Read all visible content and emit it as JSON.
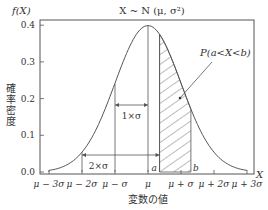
{
  "chart_data": {
    "type": "line",
    "title": "X ~ N (μ, σ²)",
    "ylabel_top": "f(X)",
    "ylabel": "確率密度",
    "xlabel": "変数の値",
    "xaxis_end_label": "X",
    "ylim": [
      0.0,
      0.42
    ],
    "xlim_sigma": [
      -3.2,
      3.3
    ],
    "yticks": [
      "0.0",
      "0.1",
      "0.2",
      "0.3",
      "0.4"
    ],
    "ytick_values": [
      0.0,
      0.1,
      0.2,
      0.3,
      0.4
    ],
    "xticks": [
      "μ − 3σ",
      "μ − 2σ",
      "μ − σ",
      "μ",
      "μ + σ",
      "μ + 2σ",
      "μ + 3σ"
    ],
    "xtick_values": [
      -3,
      -2,
      -1,
      0,
      1,
      2,
      3
    ],
    "curve": {
      "mean": 0,
      "sd": 1,
      "range": [
        -3,
        3
      ]
    },
    "shaded_region": {
      "a": 0.35,
      "b": 1.3,
      "label": "P(a<X<b)",
      "a_label": "a",
      "b_label": "b"
    },
    "annotations": [
      {
        "label": "1×σ",
        "from": 0,
        "to": -1,
        "y": 0.24
      },
      {
        "label": "2×σ",
        "from": 0,
        "to": -2,
        "y": 0.054
      }
    ]
  }
}
